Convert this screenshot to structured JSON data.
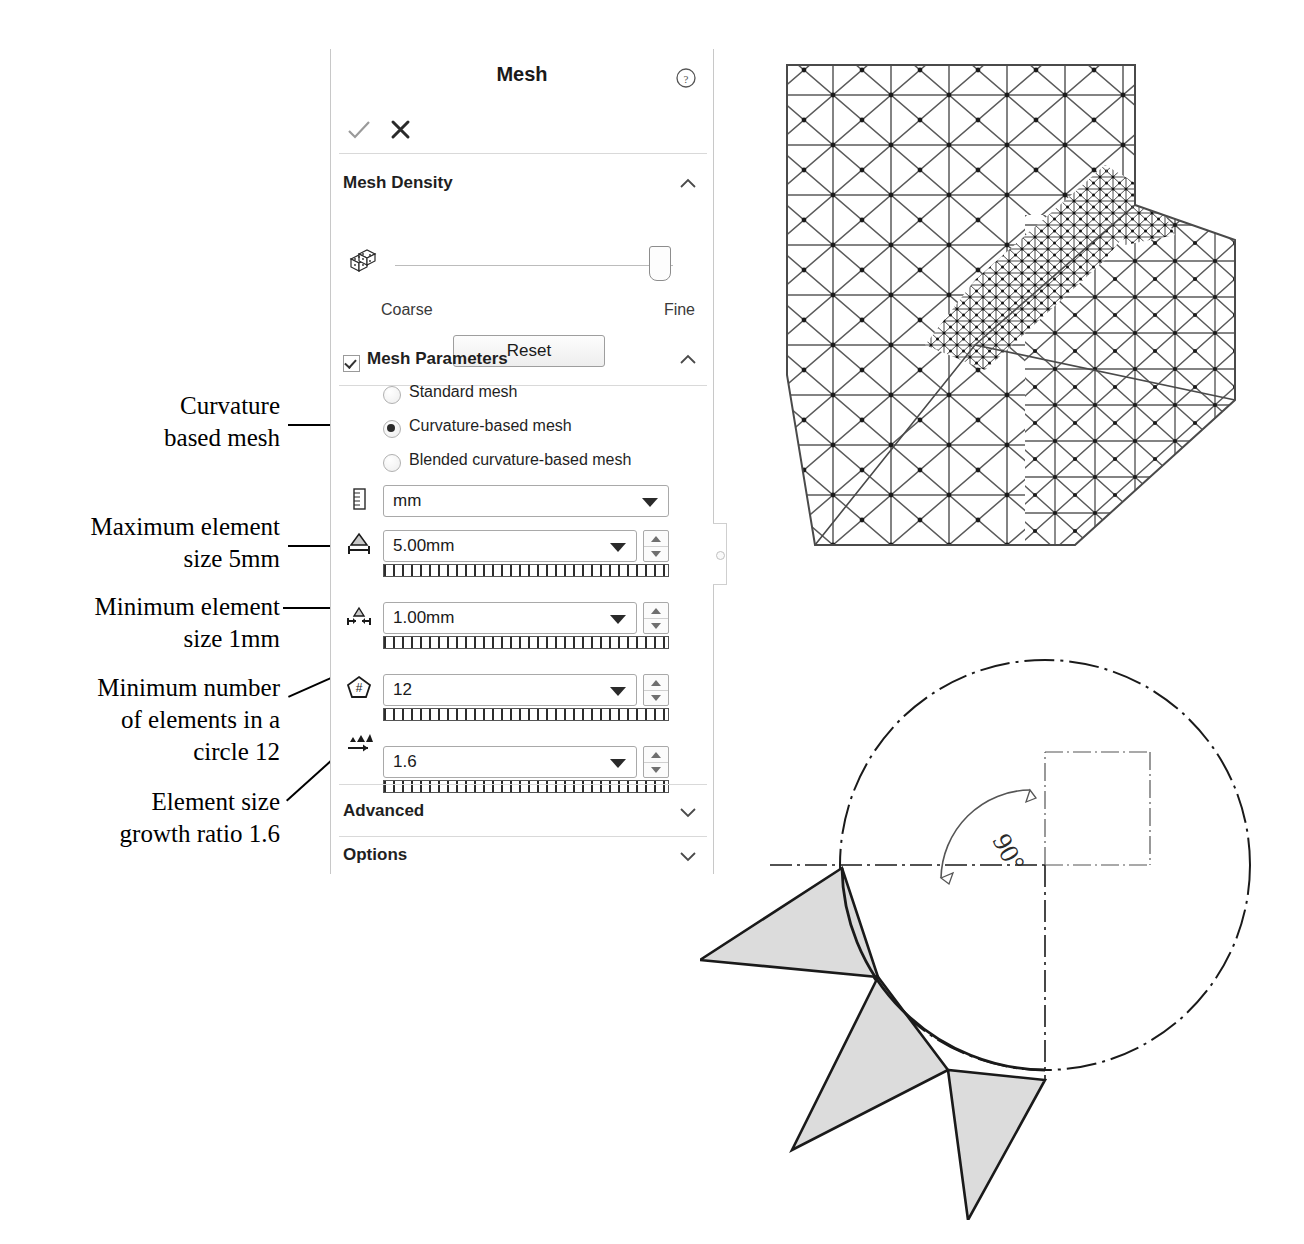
{
  "panel": {
    "title": "Mesh",
    "help_icon": "help-circle-icon",
    "accept_icon": "check-icon",
    "cancel_icon": "close-icon",
    "sections": {
      "mesh_density": {
        "label": "Mesh Density",
        "collapse_icon": "chevron-up-icon",
        "density_icon": "mesh-blocks-icon",
        "slider": {
          "min_label": "Coarse",
          "max_label": "Fine",
          "value_percent": 92
        },
        "reset_label": "Reset"
      },
      "mesh_parameters": {
        "label": "Mesh Parameters",
        "checked": true,
        "collapse_icon": "chevron-up-icon",
        "radios": [
          {
            "label": "Standard mesh",
            "selected": false
          },
          {
            "label": "Curvature-based mesh",
            "selected": true
          },
          {
            "label": "Blended curvature-based mesh",
            "selected": false
          }
        ],
        "fields": [
          {
            "icon": "ruler-units-icon",
            "value": "mm",
            "has_spinner": false,
            "has_ruler": false
          },
          {
            "icon": "max-element-size-icon",
            "value": "5.00mm",
            "has_spinner": true,
            "has_ruler": true
          },
          {
            "icon": "min-element-size-icon",
            "value": "1.00mm",
            "has_spinner": true,
            "has_ruler": true
          },
          {
            "icon": "elements-in-circle-icon",
            "value": "12",
            "has_spinner": true,
            "has_ruler": true
          },
          {
            "icon": "growth-ratio-icon",
            "value": "1.6",
            "has_spinner": true,
            "has_ruler": true
          }
        ]
      },
      "advanced": {
        "label": "Advanced",
        "expand_icon": "chevron-down-icon"
      },
      "options": {
        "label": "Options",
        "expand_icon": "chevron-down-icon"
      }
    }
  },
  "annotations": [
    {
      "id": "curvature-based-mesh",
      "lines": [
        "Curvature",
        "based mesh"
      ]
    },
    {
      "id": "maximum-element-size",
      "lines": [
        "Maximum element",
        "size 5mm"
      ]
    },
    {
      "id": "minimum-element-size",
      "lines": [
        "Minimum element",
        "size 1mm"
      ]
    },
    {
      "id": "minimum-elements-circle",
      "lines": [
        "Minimum number",
        "of elements in a",
        "circle 12"
      ]
    },
    {
      "id": "element-growth-ratio",
      "lines": [
        "Element size",
        "growth ratio 1.6"
      ]
    }
  ],
  "figures": {
    "mesh_view": {
      "name": "fea-mesh-bracket",
      "description": "Finite element triangular mesh on stepped bracket with refined fillet region"
    },
    "circle_view": {
      "name": "elements-in-circle-diagram",
      "angle_label": "90°",
      "triangle_count": 3
    }
  },
  "colors": {
    "panel_border": "#c8c8c8",
    "divider": "#d9d9d9",
    "text": "#1a1a1a",
    "mesh_line": "#5a5a5a",
    "triangle_fill": "#dcdcdc",
    "outline": "#1a1a1a"
  }
}
